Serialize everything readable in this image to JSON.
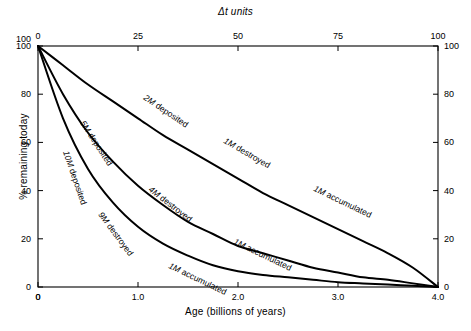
{
  "chart_data": {
    "type": "line",
    "title": "Δt units",
    "xlabel": "Age (billions of years)",
    "ylabel": "% remaining today",
    "top_axis_label": "Δt units",
    "right_axis_label": "% remaining today",
    "xlim": [
      0,
      4.0
    ],
    "ylim": [
      0,
      100
    ],
    "top_xlim": [
      0,
      100
    ],
    "right_ylim": [
      0,
      100
    ],
    "grid": false,
    "legend": "none (inline curve labels)",
    "xticks": [
      "0",
      "1.0",
      "2.0",
      "3.0",
      "4.0"
    ],
    "xtick_values": [
      0,
      1.0,
      2.0,
      3.0,
      4.0
    ],
    "top_xticks": [
      "0",
      "25",
      "50",
      "75",
      "100"
    ],
    "top_xtick_values": [
      0,
      25,
      50,
      75,
      100
    ],
    "yticks": [
      "0",
      "20",
      "40",
      "60",
      "80",
      "100"
    ],
    "ytick_values": [
      0,
      20,
      40,
      60,
      80,
      100
    ],
    "right_yticks": [
      "0",
      "20",
      "40",
      "60",
      "80",
      "100"
    ],
    "right_ytick_values": [
      0,
      20,
      40,
      60,
      80,
      100
    ],
    "series": [
      {
        "name": "2M deposited / 1M destroyed / 1M accumulated",
        "labels": [
          "2M deposited",
          "1M destroyed",
          "1M accumulated"
        ],
        "x": [
          0,
          0.25,
          0.5,
          0.75,
          1.0,
          1.25,
          1.5,
          1.75,
          2.0,
          2.25,
          2.5,
          2.75,
          3.0,
          3.25,
          3.5,
          3.75,
          4.0
        ],
        "values": [
          100,
          92,
          84,
          77,
          70,
          63,
          57,
          51,
          45,
          39,
          34,
          29,
          24,
          19,
          14,
          8,
          0
        ]
      },
      {
        "name": "5M deposited / 4M destroyed / 1M accumulated",
        "labels": [
          "5M deposited",
          "4M destroyed",
          "1M accumulated"
        ],
        "x": [
          0,
          0.25,
          0.5,
          0.75,
          1.0,
          1.25,
          1.5,
          1.75,
          2.0,
          2.25,
          2.5,
          2.75,
          3.0,
          3.25,
          3.5,
          3.75,
          4.0
        ],
        "values": [
          100,
          80,
          64,
          52,
          42,
          34,
          27,
          22,
          17,
          14,
          11,
          8,
          6,
          4,
          3,
          1.5,
          0
        ]
      },
      {
        "name": "10M deposited / 9M destroyed / 1M accumulated",
        "labels": [
          "10M deposited",
          "9M destroyed",
          "1M accumulated"
        ],
        "x": [
          0,
          0.25,
          0.5,
          0.75,
          1.0,
          1.25,
          1.5,
          1.75,
          2.0,
          2.25,
          2.5,
          2.75,
          3.0,
          3.25,
          3.5,
          3.75,
          4.0
        ],
        "values": [
          100,
          70,
          49,
          35,
          25,
          18,
          13,
          9,
          6.5,
          5,
          4,
          3,
          2,
          1.5,
          1,
          0.5,
          0
        ]
      }
    ],
    "annotations": [
      {
        "text": "2M deposited",
        "x": 1.05,
        "y": 78
      },
      {
        "text": "1M destroyed",
        "x": 1.85,
        "y": 60
      },
      {
        "text": "1M accumulated",
        "x": 2.75,
        "y": 40
      },
      {
        "text": "5M deposited",
        "x": 0.42,
        "y": 68
      },
      {
        "text": "4M destroyed",
        "x": 1.1,
        "y": 40
      },
      {
        "text": "1M accumulated",
        "x": 1.95,
        "y": 18
      },
      {
        "text": "10M deposited",
        "x": 0.25,
        "y": 56
      },
      {
        "text": "9M destroyed",
        "x": 0.6,
        "y": 30
      },
      {
        "text": "1M accumulated",
        "x": 1.3,
        "y": 8
      }
    ]
  },
  "figure": {
    "background": "#ffffff",
    "line_color": "#000000"
  }
}
